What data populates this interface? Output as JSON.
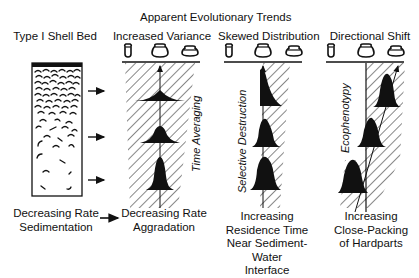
{
  "title": "Apparent Evolutionary Trends",
  "shell_bed": {
    "heading": "Type I Shell Bed",
    "caption_line1": "Decreasing Rate",
    "caption_line2": "Sedimentation"
  },
  "panels": [
    {
      "heading": "Increased Variance",
      "process": "Time Averaging",
      "caption": [
        "Decreasing Rate",
        "Aggradation"
      ]
    },
    {
      "heading": "Skewed Distribution",
      "process": "Selective Destruction",
      "caption": [
        "Increasing",
        "Residence Time",
        "Near Sediment-Water",
        "Interface"
      ]
    },
    {
      "heading": "Directional Shift",
      "process": "Ecophenotypy",
      "caption": [
        "Increasing",
        "Close-Packing",
        "of Hardparts"
      ]
    }
  ],
  "morphotype_icons": [
    "narrow-shell-icon",
    "round-shell-icon",
    "wide-shell-icon"
  ],
  "colors": {
    "ink": "#111111",
    "background": "#ffffff"
  }
}
